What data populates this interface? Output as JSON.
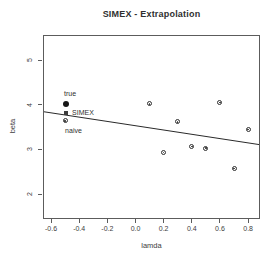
{
  "figure": {
    "title": "SIMEX - Extrapolation"
  },
  "chart_data": {
    "type": "scatter",
    "title": "SIMEX - Extrapolation",
    "xlabel": "lamda",
    "ylabel": "beta",
    "xlim": [
      -0.657,
      0.87
    ],
    "ylim": [
      1.49,
      5.56
    ],
    "x_ticks": [
      "-0.6",
      "-0.4",
      "-0.2",
      "0.0",
      "0.2",
      "0.4",
      "0.6",
      "0.8"
    ],
    "y_ticks": [
      "2",
      "3",
      "4",
      "5"
    ],
    "grid": false,
    "legend_position": "none",
    "series": [
      {
        "name": "simulated-estimates",
        "marker": "circle-dot",
        "points": [
          [
            0.1,
            4.02
          ],
          [
            0.2,
            2.93
          ],
          [
            0.3,
            3.62
          ],
          [
            0.4,
            3.07
          ],
          [
            0.5,
            3.03
          ],
          [
            0.6,
            4.05
          ],
          [
            0.7,
            2.58
          ],
          [
            0.8,
            3.45
          ]
        ]
      },
      {
        "name": "true-estimate",
        "marker": "filled-circle",
        "label": "true",
        "label_pos": "above",
        "points": [
          [
            -0.5,
            4.05
          ]
        ]
      },
      {
        "name": "simex-estimate",
        "marker": "filled-square",
        "label": "SIMEX",
        "label_pos": "right",
        "points": [
          [
            -0.5,
            3.84
          ]
        ]
      },
      {
        "name": "naive-estimate",
        "marker": "circle-dot",
        "label": "naive",
        "label_pos": "below",
        "points": [
          [
            -0.5,
            3.64
          ]
        ]
      }
    ],
    "extrapolation_line": {
      "slope": -0.48,
      "intercept": 3.55
    }
  },
  "colors": {
    "background": "#ffffff",
    "axis": "#5c5c5c",
    "text": "#3d3d3d",
    "marker": "#2e2e2e",
    "true_marker": "#161616",
    "simex_marker": "#3d3d3d",
    "line": "#2a2a2a"
  }
}
